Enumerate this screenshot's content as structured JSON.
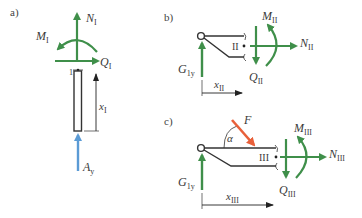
{
  "figure": {
    "panels": [
      {
        "id": "a",
        "label": "a)",
        "section": "1",
        "forces": {
          "normal": {
            "symbol": "N",
            "sub": "I"
          },
          "shear": {
            "symbol": "Q",
            "sub": "I"
          },
          "moment": {
            "symbol": "M",
            "sub": "I"
          },
          "reaction": {
            "symbol": "A",
            "sub": "y"
          }
        },
        "coordinate": {
          "symbol": "x",
          "sub": "I"
        }
      },
      {
        "id": "b",
        "label": "b)",
        "section": "II",
        "forces": {
          "normal": {
            "symbol": "N",
            "sub": "II"
          },
          "shear": {
            "symbol": "Q",
            "sub": "II"
          },
          "moment": {
            "symbol": "M",
            "sub": "II"
          },
          "reaction": {
            "symbol": "G",
            "sub": "1y"
          }
        },
        "coordinate": {
          "symbol": "x",
          "sub": "II"
        }
      },
      {
        "id": "c",
        "label": "c)",
        "section": "III",
        "forces": {
          "normal": {
            "symbol": "N",
            "sub": "III"
          },
          "shear": {
            "symbol": "Q",
            "sub": "III"
          },
          "moment": {
            "symbol": "M",
            "sub": "III"
          },
          "reaction": {
            "symbol": "G",
            "sub": "1y"
          },
          "applied": {
            "symbol": "F"
          },
          "angle": {
            "symbol": "α"
          }
        },
        "coordinate": {
          "symbol": "x",
          "sub": "III"
        }
      }
    ],
    "colors": {
      "internal_force": "#3f8f4a",
      "reaction_a": "#5b9bd5",
      "applied_force": "#e8603a",
      "structure": "#333333"
    }
  }
}
